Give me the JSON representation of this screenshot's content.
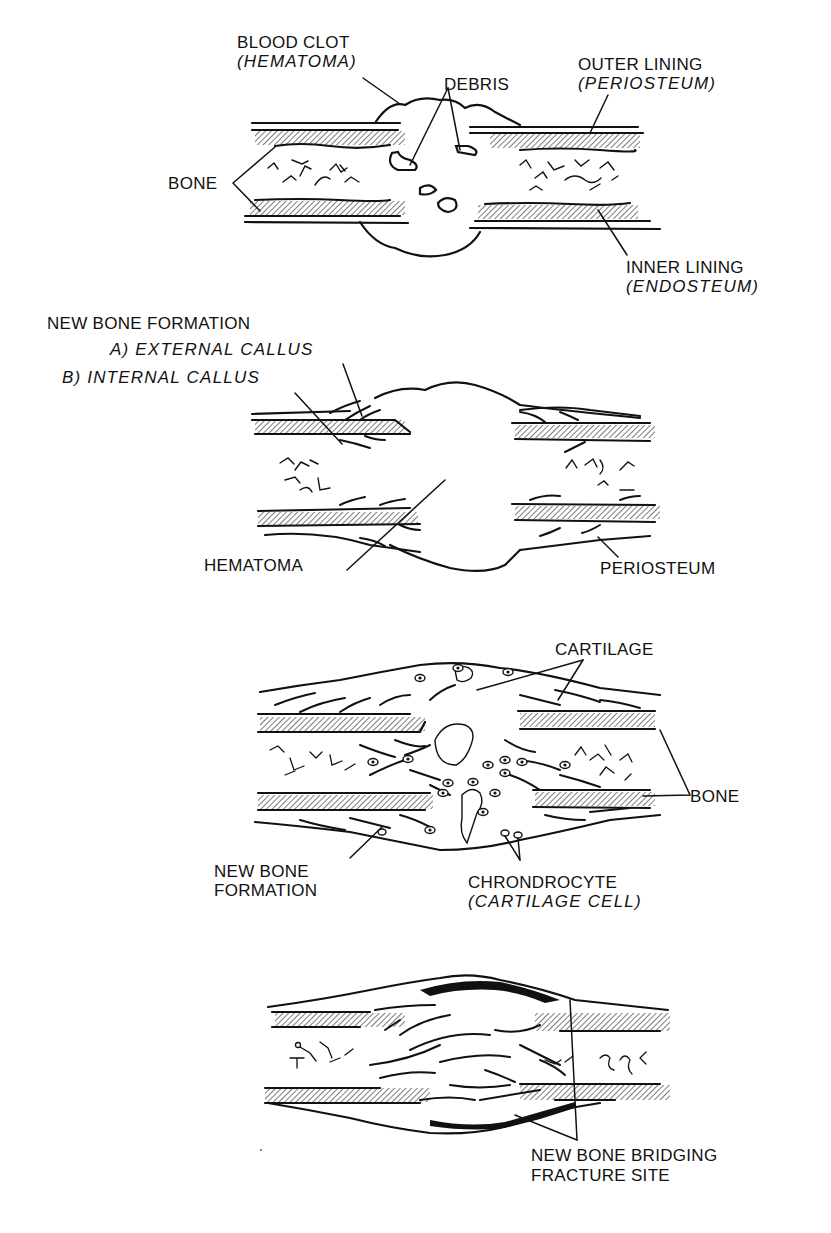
{
  "figure": {
    "colors": {
      "ink": "#111111",
      "background": "#ffffff"
    },
    "panels": [
      {
        "id": "stage-1-hematoma",
        "labels": {
          "blood_clot": "BLOOD CLOT",
          "blood_clot_sub": "(HEMATOMA)",
          "debris": "DEBRIS",
          "outer_lining": "OUTER LINING",
          "outer_lining_sub": "(PERIOSTEUM)",
          "bone": "BONE",
          "inner_lining": "INNER LINING",
          "inner_lining_sub": "(ENDOSTEUM)"
        }
      },
      {
        "id": "stage-2-callus",
        "labels": {
          "heading": "NEW BONE FORMATION",
          "external_callus": "A) EXTERNAL CALLUS",
          "internal_callus": "B) INTERNAL CALLUS",
          "hematoma": "HEMATOMA",
          "periosteum": "PERIOSTEUM"
        }
      },
      {
        "id": "stage-3-cartilage",
        "labels": {
          "cartilage": "CARTILAGE",
          "bone": "BONE",
          "new_bone_line1": "NEW BONE",
          "new_bone_line2": "FORMATION",
          "chondrocyte": "CHRONDROCYTE",
          "chondrocyte_sub": "(CARTILAGE CELL)"
        }
      },
      {
        "id": "stage-4-bridging",
        "labels": {
          "bridging_line1": "NEW BONE BRIDGING",
          "bridging_line2": "FRACTURE SITE"
        }
      }
    ]
  }
}
